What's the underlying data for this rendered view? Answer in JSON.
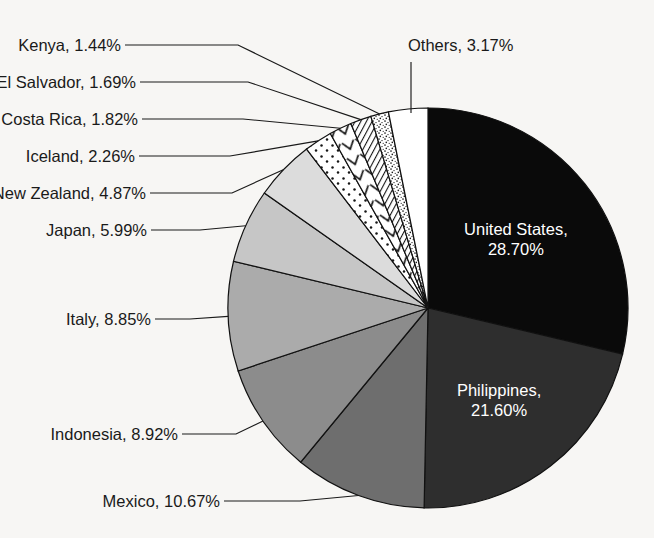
{
  "chart_data": {
    "type": "pie",
    "title": "",
    "subtitle": "",
    "xlabel": "",
    "ylabel": "",
    "legend_position": "callout-labels",
    "grid": false,
    "start_angle_deg": 0,
    "direction": "clockwise",
    "units": "percent",
    "center": {
      "x": 428,
      "y": 308,
      "r": 200
    },
    "categories": [
      "United States",
      "Philippines",
      "Mexico",
      "Indonesia",
      "Italy",
      "Japan",
      "New Zealand",
      "Iceland",
      "Costa Rica",
      "El Salvador",
      "Kenya",
      "Others"
    ],
    "values": [
      28.7,
      21.6,
      10.67,
      8.92,
      8.85,
      5.99,
      4.87,
      2.26,
      1.82,
      1.69,
      1.44,
      3.17
    ],
    "slices": [
      {
        "name": "United States",
        "value": 28.7,
        "label": "United States,",
        "label2": "28.70%",
        "value_text": "28.70%",
        "fill": "#0a0a0a",
        "fill_kind": "solid",
        "label_placement": "inside",
        "label_color": "#ffffff"
      },
      {
        "name": "Philippines",
        "value": 21.6,
        "label": "Philippines,",
        "label2": "21.60%",
        "value_text": "21.60%",
        "fill": "#2e2e2e",
        "fill_kind": "solid",
        "label_placement": "inside",
        "label_color": "#ffffff"
      },
      {
        "name": "Mexico",
        "value": 10.67,
        "label": "Mexico, 10.67%",
        "value_text": "10.67%",
        "fill": "#6e6e6e",
        "fill_kind": "solid",
        "label_placement": "callout-left",
        "label_color": "#1a1a1a"
      },
      {
        "name": "Indonesia",
        "value": 8.92,
        "label": "Indonesia, 8.92%",
        "value_text": "8.92%",
        "fill": "#8c8c8c",
        "fill_kind": "solid",
        "label_placement": "callout-left",
        "label_color": "#1a1a1a"
      },
      {
        "name": "Italy",
        "value": 8.85,
        "label": "Italy, 8.85%",
        "value_text": "8.85%",
        "fill": "#ababab",
        "fill_kind": "solid",
        "label_placement": "callout-left",
        "label_color": "#1a1a1a"
      },
      {
        "name": "Japan",
        "value": 5.99,
        "label": "Japan, 5.99%",
        "value_text": "5.99%",
        "fill": "#c6c6c6",
        "fill_kind": "solid",
        "label_placement": "callout-left",
        "label_color": "#1a1a1a"
      },
      {
        "name": "New Zealand",
        "value": 4.87,
        "label": "New Zealand, 4.87%",
        "value_text": "4.87%",
        "fill": "#dcdcdc",
        "fill_kind": "solid",
        "label_placement": "callout-left",
        "label_color": "#1a1a1a"
      },
      {
        "name": "Iceland",
        "value": 2.26,
        "label": "Iceland, 2.26%",
        "value_text": "2.26%",
        "fill": "#ffffff",
        "fill_kind": "dots",
        "label_placement": "callout-left",
        "label_color": "#1a1a1a"
      },
      {
        "name": "Costa Rica",
        "value": 1.82,
        "label": "Costa Rica, 1.82%",
        "value_text": "1.82%",
        "fill": "#ffffff",
        "fill_kind": "chevron",
        "label_placement": "callout-left",
        "label_color": "#1a1a1a"
      },
      {
        "name": "El Salvador",
        "value": 1.69,
        "label": "El Salvador, 1.69%",
        "value_text": "1.69%",
        "fill": "#ffffff",
        "fill_kind": "hatch",
        "label_placement": "callout-left",
        "label_color": "#1a1a1a"
      },
      {
        "name": "Kenya",
        "value": 1.44,
        "label": "Kenya, 1.44%",
        "value_text": "1.44%",
        "fill": "#ffffff",
        "fill_kind": "speckle",
        "label_placement": "callout-left",
        "label_color": "#1a1a1a"
      },
      {
        "name": "Others",
        "value": 3.17,
        "label": "Others, 3.17%",
        "value_text": "3.17%",
        "fill": "#ffffff",
        "fill_kind": "solid",
        "label_placement": "callout-top",
        "label_color": "#1a1a1a"
      }
    ],
    "callouts": [
      {
        "name": "Kenya",
        "text": "Kenya, 1.44%",
        "text_x": 121,
        "text_y": 51,
        "elbow_x": 238,
        "elbow_y": 45
      },
      {
        "name": "El Salvador",
        "text": "El Salvador, 1.69%",
        "text_x": 136,
        "text_y": 88,
        "elbow_x": 248,
        "elbow_y": 82
      },
      {
        "name": "Costa Rica",
        "text": "Costa Rica, 1.82%",
        "text_x": 138,
        "text_y": 125,
        "elbow_x": 243,
        "elbow_y": 119
      },
      {
        "name": "Iceland",
        "text": "Iceland, 2.26%",
        "text_x": 135,
        "text_y": 162,
        "elbow_x": 230,
        "elbow_y": 156
      },
      {
        "name": "New Zealand",
        "text": "New Zealand, 4.87%",
        "text_x": 146,
        "text_y": 199,
        "elbow_x": 232,
        "elbow_y": 193
      },
      {
        "name": "Japan",
        "text": "Japan, 5.99%",
        "text_x": 147,
        "text_y": 236,
        "elbow_x": 200,
        "elbow_y": 230
      },
      {
        "name": "Italy",
        "text": "Italy, 8.85%",
        "text_x": 151,
        "text_y": 325,
        "elbow_x": 190,
        "elbow_y": 319
      },
      {
        "name": "Indonesia",
        "text": "Indonesia, 8.92%",
        "text_x": 178,
        "text_y": 440,
        "elbow_x": 236,
        "elbow_y": 434
      },
      {
        "name": "Mexico",
        "text": "Mexico, 10.67%",
        "text_x": 220,
        "text_y": 507,
        "elbow_x": 300,
        "elbow_y": 501
      },
      {
        "name": "Others",
        "text": "Others, 3.17%",
        "text_x": 408,
        "text_y": 51,
        "elbow_x": 411,
        "elbow_y": 62
      }
    ]
  }
}
